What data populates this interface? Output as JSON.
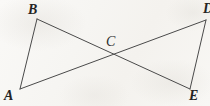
{
  "figure": {
    "kind": "geometry-diagram",
    "canvas": {
      "width": 210,
      "height": 106
    },
    "background_color": "#f7f6f3",
    "line_color": "#4a4a4a",
    "label_color": "#242424",
    "line_width": 1,
    "points": [
      {
        "id": "B",
        "label": "B",
        "x": 37,
        "y": 19,
        "label_x": 28,
        "label_y": 3,
        "cut_off": false
      },
      {
        "id": "A",
        "label": "A",
        "x": 20,
        "y": 89,
        "label_x": 4,
        "label_y": 89,
        "cut_off": false
      },
      {
        "id": "D",
        "label": "D",
        "x": 206,
        "y": 20,
        "label_x": 203,
        "label_y": 2,
        "cut_off": true
      },
      {
        "id": "E",
        "label": "E",
        "x": 190,
        "y": 89,
        "label_x": 189,
        "label_y": 89,
        "cut_off": false
      },
      {
        "id": "C",
        "label": "C",
        "x": 113,
        "y": 57,
        "label_x": 106,
        "label_y": 35,
        "cut_off": false
      }
    ],
    "segments": [
      {
        "id": "BA",
        "from": "B",
        "to": "A",
        "x1": 37,
        "y1": 19,
        "x2": 20,
        "y2": 89
      },
      {
        "id": "DE",
        "from": "D",
        "to": "E",
        "x1": 206,
        "y1": 20,
        "x2": 190,
        "y2": 89
      },
      {
        "id": "BE",
        "from": "B",
        "to": "E",
        "x1": 37,
        "y1": 19,
        "x2": 190,
        "y2": 89
      },
      {
        "id": "AD",
        "from": "A",
        "to": "D",
        "x1": 20,
        "y1": 89,
        "x2": 206,
        "y2": 20
      }
    ]
  }
}
